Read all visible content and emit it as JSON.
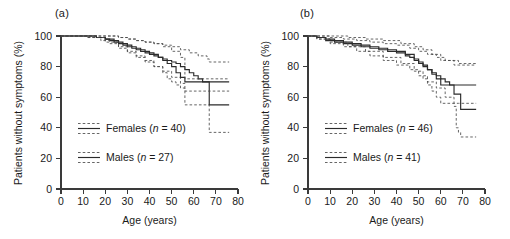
{
  "figure": {
    "background": "#ffffff",
    "axis_color": "#3a3a3a",
    "curve_color": "#2b2b2b",
    "ci_color": "#4a4a4a"
  },
  "panels": [
    {
      "label": "(a)",
      "xlabel": "Age (years)",
      "ylabel": "Patients without symptoms (%)",
      "xticks": [
        "0",
        "10",
        "20",
        "30",
        "40",
        "50",
        "60",
        "70",
        "80"
      ],
      "yticks": [
        "0",
        "20",
        "40",
        "60",
        "80",
        "100"
      ],
      "legend": [
        {
          "name": "females",
          "label_prefix": "Females (",
          "label_italic": "n",
          "label_suffix": " = 40)"
        },
        {
          "name": "males",
          "label_prefix": "Males (",
          "label_italic": "n",
          "label_suffix": " = 27)"
        }
      ]
    },
    {
      "label": "(b)",
      "xlabel": "Age (years)",
      "ylabel": "Patients without symptoms (%)",
      "xticks": [
        "0",
        "10",
        "20",
        "30",
        "40",
        "50",
        "60",
        "70",
        "80"
      ],
      "yticks": [
        "0",
        "20",
        "40",
        "60",
        "80",
        "100"
      ],
      "legend": [
        {
          "name": "females",
          "label_prefix": "Females (",
          "label_italic": "n",
          "label_suffix": " = 46)"
        },
        {
          "name": "males",
          "label_prefix": "Males (",
          "label_italic": "n",
          "label_suffix": " = 41)"
        }
      ]
    }
  ],
  "chart_data": [
    {
      "panel": "(a)",
      "type": "line",
      "title": "(a)",
      "xlabel": "Age (years)",
      "ylabel": "Patients without symptoms (%)",
      "xlim": [
        0,
        80
      ],
      "ylim": [
        0,
        100
      ],
      "xticks": [
        0,
        10,
        20,
        30,
        40,
        50,
        60,
        70,
        80
      ],
      "yticks": [
        0,
        20,
        40,
        60,
        80,
        100
      ],
      "grid": false,
      "legend_position": "center-left",
      "series": [
        {
          "name": "Females (n = 40)",
          "style": "solid",
          "role": "estimate",
          "x": [
            0,
            12,
            16,
            18,
            20,
            22,
            24,
            26,
            28,
            30,
            32,
            34,
            36,
            38,
            40,
            42,
            44,
            46,
            48,
            50,
            52,
            54,
            56,
            58,
            60,
            62,
            64,
            66,
            67,
            76
          ],
          "y": [
            100,
            100,
            99,
            99,
            98,
            97,
            96,
            95,
            94,
            93,
            92,
            91,
            90,
            89,
            88,
            87,
            86,
            85,
            84,
            83,
            82,
            80,
            78,
            76,
            74,
            72,
            70,
            70,
            55,
            55
          ]
        },
        {
          "name": "Females upper 95% CI",
          "style": "dashed",
          "role": "ci-upper",
          "x": [
            0,
            12,
            18,
            22,
            26,
            30,
            34,
            38,
            42,
            46,
            50,
            54,
            58,
            62,
            66,
            67,
            76
          ],
          "y": [
            100,
            100,
            100,
            100,
            99,
            98,
            97,
            96,
            95,
            94,
            93,
            91,
            89,
            87,
            85,
            83,
            83
          ]
        },
        {
          "name": "Females lower 95% CI",
          "style": "dashed",
          "role": "ci-lower",
          "x": [
            0,
            12,
            18,
            22,
            26,
            30,
            34,
            38,
            42,
            46,
            50,
            54,
            56,
            60,
            64,
            66,
            67,
            76
          ],
          "y": [
            100,
            99,
            97,
            95,
            92,
            89,
            86,
            83,
            80,
            77,
            73,
            69,
            55,
            55,
            55,
            55,
            37,
            37
          ]
        },
        {
          "name": "Males (n = 27)",
          "style": "solid",
          "role": "estimate",
          "x": [
            0,
            12,
            16,
            20,
            24,
            26,
            28,
            30,
            32,
            34,
            36,
            38,
            40,
            42,
            44,
            46,
            48,
            50,
            52,
            54,
            56,
            76
          ],
          "y": [
            100,
            100,
            99,
            98,
            97,
            96,
            95,
            94,
            93,
            92,
            91,
            90,
            89,
            88,
            86,
            84,
            82,
            80,
            76,
            73,
            70,
            70
          ]
        },
        {
          "name": "Males upper 95% CI",
          "style": "dashed",
          "role": "ci-upper",
          "x": [
            0,
            12,
            20,
            26,
            30,
            34,
            38,
            42,
            46,
            50,
            54,
            56,
            76
          ],
          "y": [
            100,
            100,
            100,
            99,
            98,
            97,
            96,
            95,
            93,
            90,
            86,
            72,
            72
          ]
        },
        {
          "name": "Males lower 95% CI",
          "style": "dashed",
          "role": "ci-lower",
          "x": [
            0,
            12,
            20,
            26,
            30,
            34,
            38,
            42,
            46,
            48,
            50,
            52,
            54,
            56,
            76
          ],
          "y": [
            100,
            99,
            96,
            93,
            90,
            87,
            84,
            80,
            76,
            72,
            70,
            68,
            66,
            64,
            64
          ]
        }
      ]
    },
    {
      "panel": "(b)",
      "type": "line",
      "title": "(b)",
      "xlabel": "Age (years)",
      "ylabel": "Patients without symptoms (%)",
      "xlim": [
        0,
        80
      ],
      "ylim": [
        0,
        100
      ],
      "xticks": [
        0,
        10,
        20,
        30,
        40,
        50,
        60,
        70,
        80
      ],
      "yticks": [
        0,
        20,
        40,
        60,
        80,
        100
      ],
      "grid": false,
      "legend_position": "center-left",
      "series": [
        {
          "name": "Females (n = 46)",
          "style": "solid",
          "role": "estimate",
          "x": [
            0,
            4,
            8,
            12,
            16,
            20,
            24,
            28,
            32,
            36,
            40,
            44,
            46,
            48,
            50,
            52,
            54,
            56,
            58,
            60,
            62,
            64,
            66,
            68,
            69,
            76
          ],
          "y": [
            100,
            99,
            97,
            96,
            95,
            94,
            93,
            92,
            91,
            90,
            89,
            87,
            86,
            84,
            82,
            80,
            78,
            76,
            74,
            72,
            70,
            68,
            62,
            62,
            52,
            52
          ]
        },
        {
          "name": "Females upper 95% CI",
          "style": "dashed",
          "role": "ci-upper",
          "x": [
            0,
            4,
            10,
            16,
            22,
            28,
            34,
            40,
            46,
            50,
            54,
            58,
            62,
            66,
            68,
            69,
            76
          ],
          "y": [
            100,
            100,
            99,
            98,
            97,
            96,
            95,
            94,
            92,
            90,
            88,
            86,
            84,
            81,
            81,
            81,
            81
          ]
        },
        {
          "name": "Females lower 95% CI",
          "style": "dashed",
          "role": "ci-lower",
          "x": [
            0,
            4,
            10,
            16,
            22,
            28,
            34,
            40,
            46,
            50,
            54,
            58,
            62,
            66,
            67,
            68,
            69,
            76
          ],
          "y": [
            100,
            98,
            95,
            93,
            90,
            87,
            84,
            81,
            78,
            74,
            70,
            66,
            60,
            54,
            40,
            37,
            34,
            34
          ]
        },
        {
          "name": "Males (n = 41)",
          "style": "solid",
          "role": "estimate",
          "x": [
            0,
            4,
            8,
            12,
            16,
            20,
            24,
            28,
            32,
            36,
            40,
            44,
            48,
            50,
            52,
            54,
            56,
            58,
            60,
            68,
            69,
            76
          ],
          "y": [
            100,
            99,
            98,
            97,
            96,
            95,
            94,
            93,
            92,
            91,
            90,
            88,
            85,
            83,
            81,
            78,
            75,
            72,
            68,
            68,
            68,
            68
          ]
        },
        {
          "name": "Males upper 95% CI",
          "style": "dashed",
          "role": "ci-upper",
          "x": [
            0,
            4,
            10,
            18,
            26,
            34,
            42,
            48,
            52,
            56,
            60,
            68,
            76
          ],
          "y": [
            100,
            100,
            100,
            99,
            98,
            97,
            95,
            93,
            91,
            88,
            84,
            82,
            82
          ]
        },
        {
          "name": "Males lower 95% CI",
          "style": "dashed",
          "role": "ci-lower",
          "x": [
            0,
            4,
            10,
            18,
            26,
            34,
            42,
            48,
            52,
            54,
            56,
            58,
            60,
            68,
            76
          ],
          "y": [
            100,
            98,
            96,
            93,
            90,
            86,
            82,
            77,
            72,
            68,
            64,
            60,
            56,
            56,
            56
          ]
        }
      ]
    }
  ]
}
